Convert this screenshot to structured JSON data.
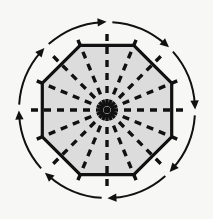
{
  "figure": {
    "title": "Octagon with radial dashed spokes and clockwise circulation arrows",
    "canvas": {
      "width": 213,
      "height": 219,
      "background": "#f7f7f6"
    },
    "shape": {
      "name": "regular-octagon",
      "sides": 8,
      "center": {
        "x": 107,
        "y": 110
      },
      "circumradius": 70,
      "rotation_deg": 22.5,
      "fill": "#dcdcdc",
      "stroke": "#111111",
      "stroke_width": 3.2,
      "vertices": [
        {
          "x": 80.2,
          "y": 45.3
        },
        {
          "x": 133.8,
          "y": 45.3
        },
        {
          "x": 171.7,
          "y": 83.2
        },
        {
          "x": 171.7,
          "y": 136.8
        },
        {
          "x": 133.8,
          "y": 174.7
        },
        {
          "x": 80.2,
          "y": 174.7
        },
        {
          "x": 42.3,
          "y": 136.8
        },
        {
          "x": 42.3,
          "y": 83.2
        }
      ]
    },
    "spokes": {
      "name": "radial-dashed-spokes",
      "count": 16,
      "angle_step_deg": 22.5,
      "inner_radius": 4,
      "outer_radius": 79,
      "stroke": "#111111",
      "stroke_width": 3.4,
      "dash_pattern": "7 6",
      "angles_deg": [
        0,
        22.5,
        45,
        67.5,
        90,
        112.5,
        135,
        157.5,
        180,
        202.5,
        225,
        247.5,
        270,
        292.5,
        315,
        337.5
      ]
    },
    "arrows": {
      "name": "clockwise-circulation-arrows",
      "count": 8,
      "direction": "clockwise",
      "radius": 88,
      "stroke": "#111111",
      "stroke_width": 2.0,
      "arc_span_deg": 38,
      "center_angles_deg": [
        247.5,
        292.5,
        337.5,
        22.5,
        67.5,
        112.5,
        157.5,
        202.5
      ]
    },
    "colors": {
      "ink": "#111111",
      "fill": "#dcdcdc",
      "background": "#f7f7f6"
    }
  }
}
